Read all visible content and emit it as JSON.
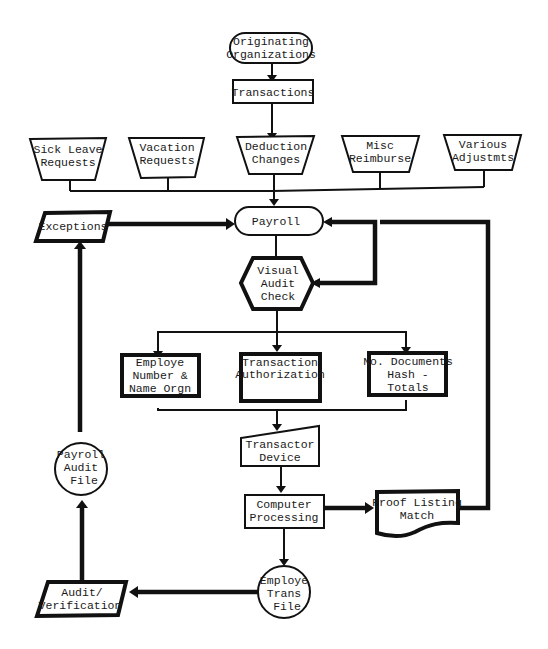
{
  "diagram": {
    "colors": {
      "ink": "#111111",
      "background": "#ffffff"
    },
    "nodes": {
      "originating": {
        "shape": "terminator",
        "lines": [
          "Originating",
          "Organizations"
        ]
      },
      "transactions": {
        "shape": "process",
        "lines": [
          "Transactions"
        ]
      },
      "sick_leave": {
        "shape": "manual-operation",
        "lines": [
          "Sick Leave",
          "Requests"
        ]
      },
      "vacation": {
        "shape": "manual-operation",
        "lines": [
          "Vacation",
          "Requests"
        ]
      },
      "deduction": {
        "shape": "manual-operation",
        "lines": [
          "Deduction",
          "Changes"
        ]
      },
      "misc": {
        "shape": "manual-operation",
        "lines": [
          "Misc",
          "Reimburse"
        ]
      },
      "various": {
        "shape": "manual-operation",
        "lines": [
          "Various",
          "Adjustmts"
        ]
      },
      "exceptions": {
        "shape": "data",
        "lines": [
          "Exceptions"
        ]
      },
      "payroll": {
        "shape": "terminator",
        "lines": [
          "Payroll"
        ]
      },
      "visual_audit": {
        "shape": "preparation",
        "lines": [
          "Visual",
          "Audit",
          "Check"
        ]
      },
      "employe_number": {
        "shape": "process",
        "lines": [
          "Employe",
          "Number &",
          "Name Orgn"
        ]
      },
      "transaction_auth": {
        "shape": "process",
        "lines": [
          "Transaction",
          "Authorization"
        ]
      },
      "no_documents": {
        "shape": "process",
        "lines": [
          "No. Documents",
          "Hash -",
          "Totals"
        ]
      },
      "transactor": {
        "shape": "manual-input",
        "lines": [
          "Transactor",
          "Device"
        ]
      },
      "computer": {
        "shape": "process",
        "lines": [
          "Computer",
          "Processing"
        ]
      },
      "proof_listing": {
        "shape": "document",
        "lines": [
          "Proof Listing",
          "Match"
        ]
      },
      "payroll_audit_file": {
        "shape": "connector-circle",
        "lines": [
          "Payroll",
          "Audit",
          "File"
        ]
      },
      "employe_trans_file": {
        "shape": "connector-circle",
        "lines": [
          "Employe",
          "Trans",
          "File"
        ]
      },
      "audit_verification": {
        "shape": "data",
        "lines": [
          "Audit/",
          "Verification"
        ]
      }
    },
    "edges": [
      {
        "from": "Originating Organizations",
        "to": "Transactions"
      },
      {
        "from": "Transactions",
        "to": "Deduction Changes"
      },
      {
        "from": "Sick Leave / Vacation / Deduction / Misc / Various",
        "to": "Payroll"
      },
      {
        "from": "Exceptions",
        "to": "Payroll"
      },
      {
        "from": "Payroll",
        "to": "Visual Audit Check"
      },
      {
        "from": "Visual Audit Check",
        "to": "Payroll",
        "note": "feedback loop"
      },
      {
        "from": "Visual Audit Check",
        "to": "Employe Number / Transaction Authorization / No. Documents"
      },
      {
        "from": "Verification boxes",
        "to": "Transactor Device"
      },
      {
        "from": "Transactor Device",
        "to": "Computer Processing"
      },
      {
        "from": "Computer Processing",
        "to": "Proof Listing Match"
      },
      {
        "from": "Proof Listing Match",
        "to": "Payroll",
        "note": "return loop"
      },
      {
        "from": "Computer Processing",
        "to": "Employe Trans File"
      },
      {
        "from": "Employe Trans File",
        "to": "Audit/Verification"
      },
      {
        "from": "Audit/Verification",
        "to": "Payroll Audit File"
      },
      {
        "from": "Payroll Audit File",
        "to": "Exceptions"
      }
    ]
  }
}
